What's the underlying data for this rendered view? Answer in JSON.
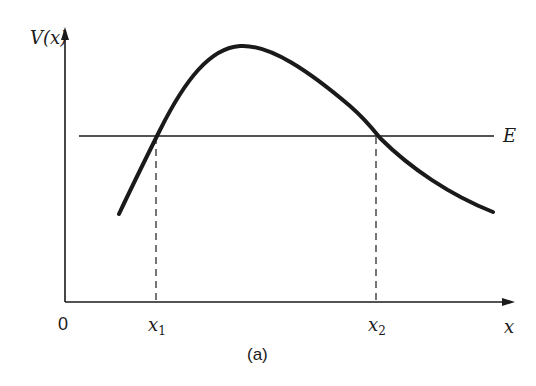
{
  "figure": {
    "caption": "(a)",
    "y_axis_label": "V(x)",
    "x_axis_label": "x",
    "origin_label": "0",
    "energy_label": "E",
    "turning_points": [
      {
        "label": "x",
        "subscript": "1"
      },
      {
        "label": "x",
        "subscript": "2"
      }
    ]
  },
  "colors": {
    "ink": "#1a1a1a",
    "background": "#ffffff"
  },
  "geometry": {
    "y_axis": {
      "x": 65,
      "y_top": 28,
      "y_bottom": 302
    },
    "x_axis": {
      "y": 302,
      "x_left": 65,
      "x_right": 514
    },
    "energy_line": {
      "y": 136,
      "x_start": 79,
      "x_end": 494
    },
    "curve": {
      "start": [
        119,
        214
      ],
      "peak": [
        243,
        46
      ],
      "end": [
        493,
        212
      ]
    },
    "x1": 156,
    "x2": 376
  }
}
